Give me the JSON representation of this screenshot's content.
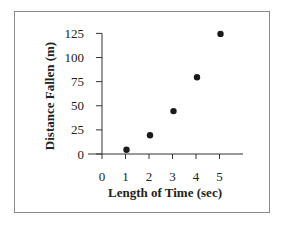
{
  "chart_data": {
    "type": "scatter",
    "title": "",
    "xlabel": "Length of Time (sec)",
    "ylabel": "Distance Fallen (m)",
    "x": [
      1,
      2,
      3,
      4,
      5
    ],
    "y": [
      5,
      20,
      45,
      80,
      125
    ],
    "series": [
      {
        "name": "Distance Fallen",
        "x": [
          1,
          2,
          3,
          4,
          5
        ],
        "values": [
          5,
          20,
          45,
          80,
          125
        ]
      }
    ],
    "xticks": [
      "0",
      "1",
      "2",
      "3",
      "4",
      "5"
    ],
    "yticks": [
      "0",
      "25",
      "50",
      "75",
      "100",
      "125"
    ],
    "xlim": [
      0,
      6
    ],
    "ylim": [
      0,
      125
    ],
    "grid": false,
    "legend": "none",
    "colors": {
      "marker": "#1a1a1a",
      "axis": "#333333",
      "frame": "#8a8a8a"
    }
  },
  "labels": {
    "xlabel": "Length of Time (sec)",
    "ylabel": "Distance Fallen (m)"
  }
}
